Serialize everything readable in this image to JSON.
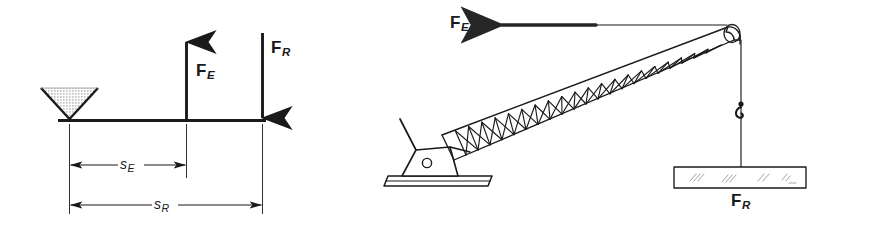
{
  "figure": {
    "background_color": "#ffffff",
    "ink_color": "#1a1a1a",
    "width": 870,
    "height": 226
  },
  "panels": [
    {
      "id": "lever-schematic",
      "name": "lever-free-body-diagram",
      "labels": {
        "effort_force": {
          "symbol": "F",
          "subscript": "E",
          "direction": "up"
        },
        "resistance_force": {
          "symbol": "F",
          "subscript": "R",
          "direction": "down"
        },
        "effort_distance": {
          "symbol": "s",
          "subscript": "E"
        },
        "resistance_distance": {
          "symbol": "s",
          "subscript": "R"
        }
      },
      "parts": {
        "fulcrum": "stippled-inverted-triangle-wedge",
        "beam": "horizontal-lever-bar"
      }
    },
    {
      "id": "crane-pictorial",
      "name": "lattice-boom-crane-diagram",
      "labels": {
        "effort_force": {
          "symbol": "F",
          "subscript": "E",
          "direction": "left"
        },
        "resistance_force": {
          "symbol": "F",
          "subscript": "R",
          "direction": "down"
        }
      },
      "parts": {
        "boom": "lattice-truss-boom-with-x-bracing",
        "boom_tip": "pulley-sheave-head",
        "cab": "trapezoidal-base-housing-with-pivot",
        "strut": "mast-strut",
        "track": "ground-rail-sled",
        "hoist": "cable-with-hook",
        "load": "rectangular-girder-load"
      }
    }
  ]
}
